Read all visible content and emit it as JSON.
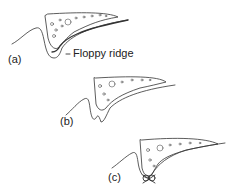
{
  "figures": [
    {
      "id": "a",
      "label": "(a)",
      "annotation": "Floppy ridge"
    },
    {
      "id": "b",
      "label": "(b)"
    },
    {
      "id": "c",
      "label": "(c)"
    }
  ],
  "colors": {
    "line": "#333333",
    "background": "#ffffff"
  }
}
